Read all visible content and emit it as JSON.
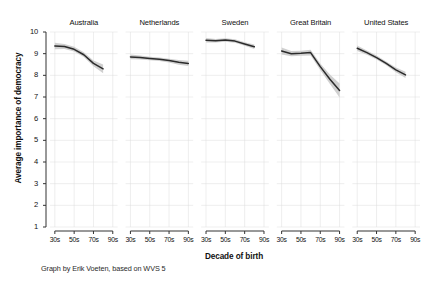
{
  "figure": {
    "ylabel": "Average importance of democracy",
    "xlabel": "Decade of birth",
    "caption": "Graph by Erik Voeten, based on WVS 5",
    "line_color": "#2b2b2b",
    "band_color": "#c8c8c8",
    "grid_color": "#dcdcdc",
    "axis_color": "#333333",
    "background": "#ffffff"
  },
  "chart_data": {
    "type": "line",
    "title": "",
    "subtitle": "",
    "xlabel": "Decade of birth",
    "ylabel": "Average importance of democracy",
    "ylim": [
      1,
      10
    ],
    "yticks": [
      1,
      2,
      3,
      4,
      5,
      6,
      7,
      8,
      9,
      10
    ],
    "xticks": [
      "30s",
      "50s",
      "70s",
      "90s"
    ],
    "xlim": [
      "30s",
      "90s"
    ],
    "grid": true,
    "legend": "none",
    "facet_layout": "1 row x 5 columns",
    "annotation": "Graph by Erik Voeten, based on WVS 5",
    "panels": [
      {
        "name": "Australia",
        "x": [
          "30s",
          "40s",
          "50s",
          "60s",
          "70s",
          "80s"
        ],
        "values": [
          9.35,
          9.33,
          9.2,
          8.95,
          8.55,
          8.3
        ],
        "ci_low": [
          9.2,
          9.22,
          9.1,
          8.85,
          8.42,
          8.1
        ],
        "ci_high": [
          9.5,
          9.45,
          9.32,
          9.06,
          8.68,
          8.5
        ]
      },
      {
        "name": "Netherlands",
        "x": [
          "30s",
          "40s",
          "50s",
          "60s",
          "70s",
          "80s",
          "90s"
        ],
        "values": [
          8.85,
          8.82,
          8.78,
          8.74,
          8.68,
          8.6,
          8.55
        ],
        "ci_low": [
          8.74,
          8.73,
          8.7,
          8.66,
          8.59,
          8.49,
          8.43
        ],
        "ci_high": [
          8.96,
          8.91,
          8.86,
          8.82,
          8.77,
          8.71,
          8.67
        ]
      },
      {
        "name": "Sweden",
        "x": [
          "30s",
          "40s",
          "50s",
          "60s",
          "70s",
          "80s"
        ],
        "values": [
          9.62,
          9.6,
          9.63,
          9.58,
          9.45,
          9.32
        ],
        "ci_low": [
          9.52,
          9.52,
          9.55,
          9.5,
          9.37,
          9.22
        ],
        "ci_high": [
          9.72,
          9.68,
          9.71,
          9.66,
          9.53,
          9.42
        ]
      },
      {
        "name": "Great Britain",
        "x": [
          "30s",
          "40s",
          "50s",
          "60s",
          "70s",
          "80s",
          "90s"
        ],
        "values": [
          9.12,
          9.0,
          9.02,
          9.05,
          8.4,
          7.82,
          7.3
        ],
        "ci_low": [
          8.96,
          8.88,
          8.9,
          8.92,
          8.25,
          7.6,
          6.98
        ],
        "ci_high": [
          9.28,
          9.12,
          9.14,
          9.18,
          8.55,
          8.04,
          7.62
        ]
      },
      {
        "name": "United States",
        "x": [
          "30s",
          "40s",
          "50s",
          "60s",
          "70s",
          "80s"
        ],
        "values": [
          9.25,
          9.05,
          8.82,
          8.55,
          8.25,
          8.02
        ],
        "ci_low": [
          9.12,
          8.95,
          8.73,
          8.46,
          8.14,
          7.88
        ],
        "ci_high": [
          9.38,
          9.15,
          8.91,
          8.64,
          8.36,
          8.16
        ]
      }
    ]
  },
  "panel_titles": [
    "Australia",
    "Netherlands",
    "Sweden",
    "Great Britain",
    "United States"
  ],
  "ytick_labels": [
    "10",
    "9",
    "8",
    "7",
    "6",
    "5",
    "4",
    "3",
    "2",
    "1"
  ],
  "xtick_labels": [
    "30s",
    "50s",
    "70s",
    "90s"
  ]
}
